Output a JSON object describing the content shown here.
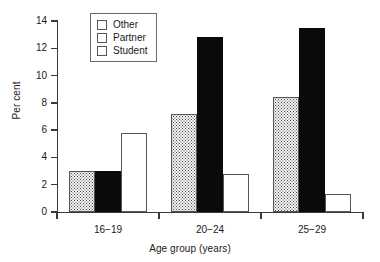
{
  "chart_data": {
    "type": "bar",
    "title": "",
    "subtitle": "",
    "xlabel": "Age group (years)",
    "ylabel": "Per cent",
    "categories": [
      "16−19",
      "20−24",
      "25−29"
    ],
    "series": [
      {
        "name": "Other",
        "values": [
          3.0,
          7.2,
          8.4
        ],
        "fill": "stippled",
        "color": "#f4f4f4"
      },
      {
        "name": "Partner",
        "values": [
          3.0,
          12.8,
          13.5
        ],
        "fill": "solid",
        "color": "#0a0a0a"
      },
      {
        "name": "Student",
        "values": [
          5.8,
          2.8,
          1.3
        ],
        "fill": "hollow",
        "color": "#ffffff"
      }
    ],
    "ylim": [
      0,
      14
    ],
    "ytick_values": [
      0,
      2,
      4,
      6,
      8,
      10,
      12,
      14
    ],
    "ytick_labels": [
      "0",
      "2",
      "4",
      "6",
      "8",
      "10",
      "12",
      "14"
    ],
    "grid": false,
    "legend_position": "upper-left-inside"
  },
  "legend": {
    "entries": [
      {
        "label": "Other"
      },
      {
        "label": "Partner"
      },
      {
        "label": "Student"
      }
    ]
  }
}
